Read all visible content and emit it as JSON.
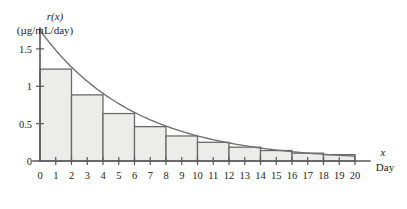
{
  "chart_data": {
    "type": "bar",
    "title": "",
    "subtitle": "",
    "ylabel_line1": "r(x)",
    "ylabel_line2": "(µg/mL/day)",
    "xlabel_symbol": "x",
    "xlabel_name": "Day",
    "grid": false,
    "legend": "none",
    "xlim": [
      0,
      20
    ],
    "ylim": [
      0,
      1.78
    ],
    "x_ticks": [
      0,
      1,
      2,
      3,
      4,
      5,
      6,
      7,
      8,
      9,
      10,
      11,
      12,
      13,
      14,
      15,
      16,
      17,
      18,
      19,
      20
    ],
    "x_tick_labels": [
      "0",
      "1",
      "2",
      "3",
      "4",
      "5",
      "6",
      "7",
      "8",
      "9",
      "10",
      "11",
      "12",
      "13",
      "14",
      "15",
      "16",
      "17",
      "18",
      "19",
      "20"
    ],
    "y_ticks": [
      0,
      0.5,
      1,
      1.5
    ],
    "y_tick_labels": [
      "0",
      "0.5",
      "1",
      "1.5"
    ],
    "bar_width_days": 2,
    "bar_rule": "right-endpoint",
    "categories": [
      "0-2",
      "2-4",
      "4-6",
      "6-8",
      "8-10",
      "10-12",
      "12-14",
      "14-16",
      "16-18",
      "18-20"
    ],
    "bar_left_edges": [
      0,
      2,
      4,
      6,
      8,
      10,
      12,
      14,
      16,
      18
    ],
    "bar_right_edges": [
      2,
      4,
      6,
      8,
      10,
      12,
      14,
      16,
      18,
      20
    ],
    "values": [
      1.23,
      0.885,
      0.635,
      0.46,
      0.335,
      0.25,
      0.185,
      0.14,
      0.105,
      0.085
    ],
    "curve": {
      "name": "r(x)",
      "model": "1.75*e^(-0.165x)",
      "x": [
        0,
        1,
        2,
        3,
        4,
        5,
        6,
        7,
        8,
        9,
        10,
        11,
        12,
        13,
        14,
        15,
        16,
        17,
        18,
        19,
        20
      ],
      "y": [
        1.75,
        1.485,
        1.23,
        1.05,
        0.885,
        0.75,
        0.635,
        0.54,
        0.46,
        0.392,
        0.335,
        0.29,
        0.25,
        0.215,
        0.185,
        0.16,
        0.14,
        0.12,
        0.105,
        0.094,
        0.085
      ]
    },
    "colors": {
      "bar_fill": "#ececeb",
      "bar_stroke": "#6a6a6c",
      "curve_stroke": "#6e6e70",
      "axis": "#58585a",
      "text": "#1b1b1b"
    }
  }
}
